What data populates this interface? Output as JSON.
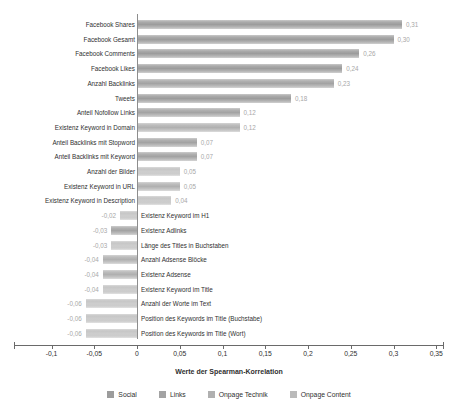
{
  "chart_data": {
    "type": "bar",
    "orientation": "horizontal",
    "title": "",
    "xlabel": "Werte der Spearman-Korrelation",
    "ylabel": "",
    "xlim": [
      -0.1,
      0.375
    ],
    "grid": false,
    "legend_position": "bottom",
    "tick_labels": [
      "-0,1",
      "-0,05",
      "0",
      "0,05",
      "0,1",
      "0,15",
      "0,2",
      "0,25",
      "0,3",
      "0,35"
    ],
    "tick_values": [
      -0.1,
      -0.05,
      0,
      0.05,
      0.1,
      0.15,
      0.2,
      0.25,
      0.3,
      0.35
    ],
    "legend": [
      {
        "label": "Social",
        "color": "#9c9c9c"
      },
      {
        "label": "Links",
        "color": "#a3a3a3"
      },
      {
        "label": "Onpage Technik",
        "color": "#b0b0b0"
      },
      {
        "label": "Onpage Content",
        "color": "#bababa"
      }
    ],
    "categories": [
      "Facebook Shares",
      "Facebook Gesamt",
      "Facebook Comments",
      "Facebook Likes",
      "Anzahl Backlinks",
      "Tweets",
      "Anteil Nofollow Links",
      "Existenz Keyword in Domain",
      "Anteil Backlinks mit Stopword",
      "Anteil Backlinks mit Keyword",
      "Anzahl der Bilder",
      "Existenz Keyword in URL",
      "Existenz Keyword in Description",
      "Existenz Keyword im H1",
      "Existenz Adlinks",
      "Länge des Titles in Buchstaben",
      "Anzahl Adsense Blöcke",
      "Existenz Adsense",
      "Existenz Keyword im Title",
      "Anzahl der Worte im Text",
      "Position des Keywords im Title (Buchstabe)",
      "Position des Keywords im Title (Wort)"
    ],
    "values": [
      0.31,
      0.3,
      0.26,
      0.24,
      0.23,
      0.18,
      0.12,
      0.12,
      0.07,
      0.07,
      0.05,
      0.05,
      0.04,
      -0.02,
      -0.03,
      -0.03,
      -0.04,
      -0.04,
      -0.04,
      -0.06,
      -0.06,
      -0.06
    ],
    "value_labels": [
      "0,31",
      "0,30",
      "0,26",
      "0,24",
      "0,23",
      "0,18",
      "0,12",
      "0,12",
      "0,07",
      "0,07",
      "0,05",
      "0,05",
      "0,04",
      "-0,02",
      "-0,03",
      "-0,03",
      "-0,04",
      "-0,04",
      "-0,04",
      "-0,06",
      "-0,06",
      "-0,06"
    ],
    "series_of": [
      "social",
      "social",
      "social",
      "social",
      "links",
      "social",
      "links",
      "technik",
      "links",
      "links",
      "content",
      "technik",
      "content",
      "content",
      "links",
      "content",
      "technik",
      "technik",
      "content",
      "content",
      "content",
      "content"
    ]
  }
}
